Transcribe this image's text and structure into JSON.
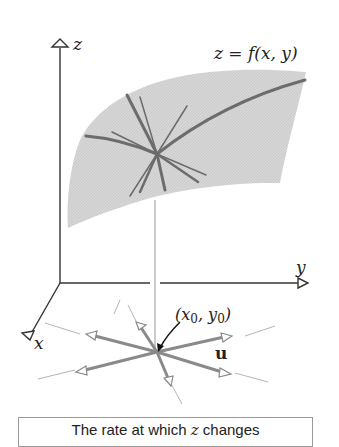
{
  "figure": {
    "axes": {
      "z_label": "z",
      "y_label": "y",
      "x_label": "x"
    },
    "surface_label": "z = f(x, y)",
    "point_label": "(x0, y0)",
    "point_label_parts": {
      "open": "(",
      "x": "x",
      "x_sub": "0",
      "sep": ", ",
      "y": "y",
      "y_sub": "0",
      "close": ")"
    },
    "vector_label": "u",
    "colors": {
      "surface_fill": "#d4d4d4",
      "curve": "#6e6e6e",
      "axis": "#333333",
      "arrow": "#8c8c8c",
      "guide": "#b5b5b5"
    }
  },
  "caption": {
    "prefix": "The rate at which ",
    "var": "z",
    "suffix": " changes"
  }
}
